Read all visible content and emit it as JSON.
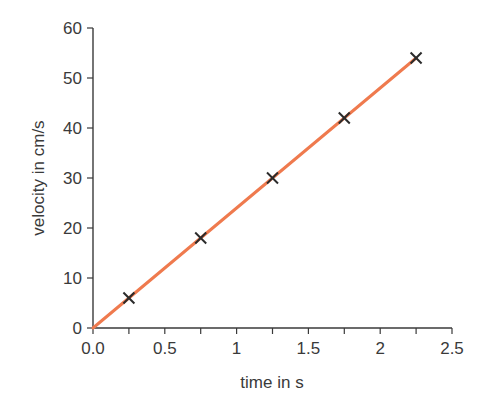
{
  "chart_data": {
    "type": "line",
    "title": "",
    "xlabel": "time in s",
    "ylabel": "velocity in cm/s",
    "xlim": [
      0,
      2.5
    ],
    "ylim": [
      0,
      60
    ],
    "x_ticks": [
      0.0,
      0.5,
      1,
      1.5,
      2,
      2.5
    ],
    "x_tick_labels": [
      "0.0",
      "0.5",
      "1",
      "1.5",
      "2",
      "2.5"
    ],
    "x_minor_ticks": [
      0.25,
      0.75,
      1.25,
      1.75,
      2.25
    ],
    "y_ticks": [
      0,
      10,
      20,
      30,
      40,
      50,
      60
    ],
    "y_tick_labels": [
      "0",
      "10",
      "20",
      "30",
      "40",
      "50",
      "60"
    ],
    "grid": false,
    "series": [
      {
        "name": "measured points",
        "marker": "x",
        "color": "#2b2b2b",
        "x": [
          0.25,
          0.75,
          1.25,
          1.75,
          2.25
        ],
        "y": [
          6,
          18,
          30,
          42,
          54
        ]
      },
      {
        "name": "best-fit line",
        "style": "line",
        "color": "#ef7a4e",
        "x": [
          0,
          2.25
        ],
        "y": [
          0,
          54
        ]
      }
    ]
  },
  "colors": {
    "axis": "#3a3a3a",
    "line": "#ef7a4e",
    "marker": "#2b2b2b"
  }
}
